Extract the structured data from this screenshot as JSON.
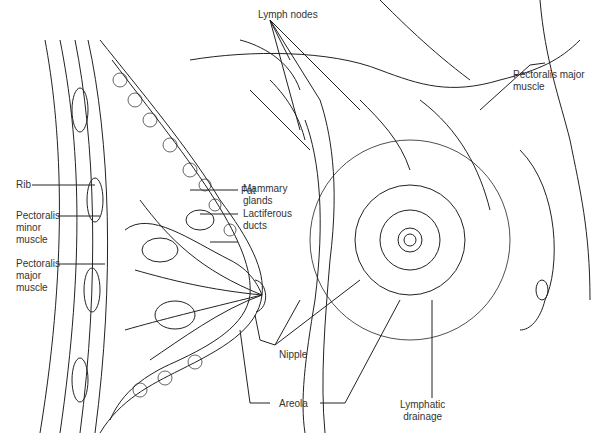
{
  "diagram": {
    "type": "anatomical-illustration",
    "labels": {
      "lymph_nodes": "Lymph nodes",
      "pectoralis_major_right": "Pectoralis major\nmuscle",
      "fat": "Fat",
      "mammary_glands": "Mammary\nglands",
      "lactiferous_ducts": "Lactiferous\nducts",
      "rib": "Rib",
      "pectoralis_minor": "Pectoralis\nminor\nmuscle",
      "pectoralis_major_left": "Pectoralis\nmajor\nmuscle",
      "nipple": "Nipple",
      "areola": "Areola",
      "lymphatic_drainage": "Lymphatic\ndrainage"
    }
  }
}
